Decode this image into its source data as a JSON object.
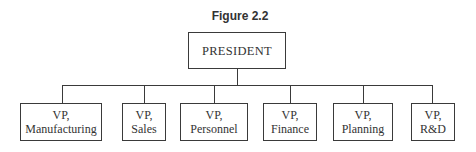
{
  "figure": {
    "title": "Figure 2.2"
  },
  "org_chart": {
    "root": {
      "label": "PRESIDENT"
    },
    "children": [
      {
        "line1": "VP,",
        "line2": "Manufacturing"
      },
      {
        "line1": "VP,",
        "line2": "Sales"
      },
      {
        "line1": "VP,",
        "line2": "Personnel"
      },
      {
        "line1": "VP,",
        "line2": "Finance"
      },
      {
        "line1": "VP,",
        "line2": "Planning"
      },
      {
        "line1": "VP,",
        "line2": "R&D"
      }
    ]
  },
  "colors": {
    "line": "#3a3a3a",
    "text": "#333333",
    "background": "#ffffff"
  }
}
